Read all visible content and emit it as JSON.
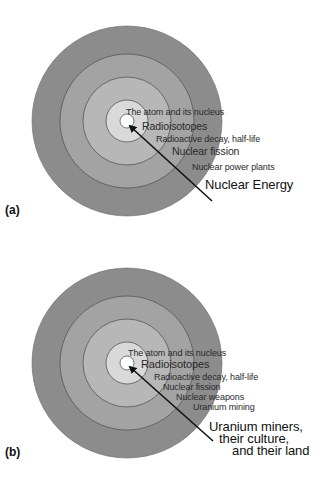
{
  "figure": {
    "panels": [
      {
        "tag": "(a)",
        "center": [
          127,
          121
        ],
        "radii": [
          95,
          67,
          44,
          21,
          7
        ],
        "ring_colors": [
          "#8c8c8c",
          "#a3a3a3",
          "#b7b7b7",
          "#d9d9d9",
          "#ffffff"
        ],
        "arrow": {
          "from": [
            212,
            201
          ],
          "to": [
            129,
            125
          ]
        },
        "labels": [
          "The atom and its nucleus",
          "Radioisotopes",
          "Radioactive decay, half-life",
          "Nuclear fission",
          "Nuclear power plants"
        ],
        "outer_label": [
          "Nuclear Energy"
        ]
      },
      {
        "tag": "(b)",
        "center": [
          127,
          121
        ],
        "radii": [
          95,
          67,
          44,
          21,
          7
        ],
        "ring_colors": [
          "#8c8c8c",
          "#a3a3a3",
          "#b7b7b7",
          "#d9d9d9",
          "#ffffff"
        ],
        "arrow": {
          "from": [
            213,
            199
          ],
          "to": [
            129,
            124
          ]
        },
        "labels": [
          "The atom and its nucleus",
          "Radioisotopes",
          "Radioactive decay, half-life",
          "Nuclear fission",
          "Nuclear weapons",
          "Uranium mining"
        ],
        "outer_label": [
          "Uranium miners,",
          "their culture,",
          "and their land"
        ]
      }
    ]
  }
}
